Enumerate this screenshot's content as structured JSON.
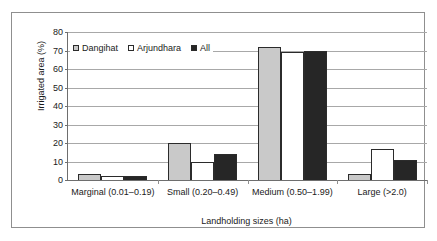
{
  "chart_data": {
    "type": "bar",
    "title": "",
    "xlabel": "Landholding sizes (ha)",
    "ylabel": "Irrigated area (%)",
    "categories": [
      "Marginal (0.01–0.19)",
      "Small (0.20–0.49)",
      "Medium (0.50–1.99)",
      "Large (>2.0)"
    ],
    "series": [
      {
        "name": "Dangihat",
        "color": "#c9c9c9",
        "values": [
          3,
          20,
          72,
          3
        ]
      },
      {
        "name": "Arjundhara",
        "color": "#ffffff",
        "values": [
          2,
          10,
          69,
          17
        ]
      },
      {
        "name": "All",
        "color": "#262626",
        "values": [
          2,
          14,
          70,
          11
        ]
      }
    ],
    "ylim": [
      0,
      80
    ],
    "ytick_step": 10,
    "yticks": [
      80,
      70,
      60,
      50,
      40,
      30,
      20,
      10,
      0
    ],
    "grid": true,
    "legend_position": "inside-top-left"
  }
}
